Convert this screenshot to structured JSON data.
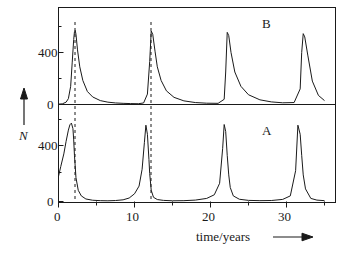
{
  "figure": {
    "background": "#ffffff",
    "line_color": "#1a1a1a",
    "dash_color": "#1a1a1a"
  },
  "axes": {
    "y_axis_label": "N",
    "y_axis_arrow": "up-arrow",
    "x_axis_title": "time/years",
    "x_axis_arrow": "right-arrow"
  },
  "panels": [
    {
      "id": "B",
      "label": "B",
      "ytick_labels": [
        "400",
        "0"
      ]
    },
    {
      "id": "A",
      "label": "A",
      "ytick_labels": [
        "400",
        "0"
      ]
    }
  ],
  "xticks": {
    "major_values": [
      0,
      10,
      20,
      30
    ],
    "major_labels": [
      "0",
      "10",
      "20",
      "30"
    ],
    "minor_values": [
      5,
      15,
      25,
      35
    ]
  },
  "chart_data": {
    "type": "line",
    "title": "",
    "xlabel": "time/years",
    "ylabel": "N",
    "xlim": [
      0,
      35
    ],
    "grid": false,
    "legend": "none",
    "panel_labels": [
      "B",
      "A"
    ],
    "dashed_guides": [
      2.2,
      12.2
    ],
    "series": [
      {
        "name": "B",
        "panel": "B",
        "ylim": [
          0,
          620
        ],
        "ytick_values": [
          0,
          400
        ],
        "ytick_labels": [
          "0",
          "400"
        ],
        "peak_times": [
          2.2,
          12.2,
          22.2,
          32.2
        ],
        "peak_values": [
          570,
          565,
          555,
          545
        ],
        "shape": "sharp-rise-slow-decay",
        "x": [
          0,
          0.5,
          1.0,
          1.3,
          1.6,
          1.8,
          2.0,
          2.1,
          2.2,
          2.3,
          2.5,
          2.8,
          3.2,
          3.8,
          4.5,
          5.5,
          6.5,
          7.5,
          8.5,
          9.5,
          10.5,
          11.2,
          11.7,
          12.0,
          12.2,
          12.4,
          12.7,
          13.0,
          13.5,
          14.2,
          15.2,
          16.5,
          18.0,
          19.5,
          21.0,
          21.8,
          22.0,
          22.2,
          22.4,
          22.7,
          23.2,
          24.0,
          25.0,
          26.5,
          28.0,
          29.5,
          31.0,
          31.8,
          32.0,
          32.2,
          32.4,
          32.8,
          33.4,
          34.2,
          35.0
        ],
        "y": [
          3,
          5,
          18,
          45,
          140,
          320,
          500,
          560,
          570,
          540,
          420,
          290,
          185,
          100,
          58,
          30,
          18,
          12,
          9,
          7,
          6,
          12,
          80,
          330,
          565,
          540,
          410,
          290,
          185,
          105,
          55,
          28,
          15,
          10,
          9,
          40,
          250,
          555,
          530,
          400,
          250,
          140,
          75,
          36,
          20,
          13,
          15,
          120,
          400,
          545,
          520,
          380,
          180,
          70,
          30
        ]
      },
      {
        "name": "A",
        "panel": "A",
        "ylim": [
          0,
          620
        ],
        "ytick_values": [
          0,
          400
        ],
        "ytick_labels": [
          "0",
          "400"
        ],
        "peak_times": [
          1.7,
          11.5,
          21.8,
          31.5
        ],
        "peak_values": [
          560,
          545,
          550,
          545
        ],
        "shape": "slow-rise-sharp-fall",
        "x": [
          0,
          0.3,
          0.7,
          1.0,
          1.3,
          1.5,
          1.7,
          1.9,
          2.0,
          2.1,
          2.3,
          2.6,
          3.0,
          3.6,
          4.5,
          5.5,
          6.5,
          7.5,
          8.5,
          9.3,
          10.0,
          10.6,
          11.0,
          11.3,
          11.5,
          11.7,
          11.9,
          12.0,
          12.2,
          12.5,
          13.0,
          13.8,
          15.0,
          16.5,
          18.0,
          19.5,
          20.5,
          21.2,
          21.6,
          21.8,
          22.0,
          22.2,
          22.4,
          22.6,
          23.0,
          23.8,
          25.0,
          26.5,
          28.0,
          29.5,
          30.5,
          31.2,
          31.5,
          31.8,
          32.0,
          32.2,
          32.5,
          33.2,
          34.0,
          35.0
        ],
        "y": [
          180,
          250,
          340,
          430,
          510,
          548,
          560,
          520,
          440,
          330,
          170,
          80,
          40,
          18,
          9,
          6,
          5,
          7,
          12,
          25,
          55,
          110,
          230,
          420,
          545,
          480,
          300,
          200,
          80,
          30,
          14,
          8,
          5,
          6,
          10,
          22,
          48,
          130,
          380,
          550,
          500,
          330,
          190,
          100,
          40,
          16,
          8,
          6,
          7,
          15,
          40,
          220,
          545,
          480,
          330,
          190,
          90,
          22,
          10,
          6
        ]
      }
    ]
  }
}
